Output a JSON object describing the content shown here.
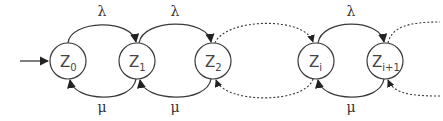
{
  "diagram": {
    "type": "state-transition",
    "states": [
      {
        "id": "Z0",
        "base": "Z",
        "sub": "0",
        "cx": 68,
        "cy": 61
      },
      {
        "id": "Z1",
        "base": "Z",
        "sub": "1",
        "cx": 137,
        "cy": 61
      },
      {
        "id": "Z2",
        "base": "Z",
        "sub": "2",
        "cx": 213,
        "cy": 61
      },
      {
        "id": "Zi",
        "base": "Z",
        "sub": "i",
        "cx": 316,
        "cy": 61
      },
      {
        "id": "Zi+1",
        "base": "Z",
        "sub": "i+1",
        "cx": 385,
        "cy": 61
      }
    ],
    "initial_arrow": {
      "to": "Z0"
    },
    "forward_rate": "λ",
    "backward_rate": "μ",
    "forward_edges": [
      {
        "from": "Z0",
        "to": "Z1",
        "label": "λ",
        "style": "solid"
      },
      {
        "from": "Z1",
        "to": "Z2",
        "label": "λ",
        "style": "solid"
      },
      {
        "from": "Z2",
        "to": "Zi",
        "label": "",
        "style": "dotted"
      },
      {
        "from": "Zi",
        "to": "Zi+1",
        "label": "λ",
        "style": "solid"
      },
      {
        "from": "Zi+1",
        "to": "…",
        "label": "",
        "style": "dotted"
      }
    ],
    "backward_edges": [
      {
        "from": "Z1",
        "to": "Z0",
        "label": "μ",
        "style": "solid"
      },
      {
        "from": "Z2",
        "to": "Z1",
        "label": "μ",
        "style": "solid"
      },
      {
        "from": "Zi",
        "to": "Z2",
        "label": "",
        "style": "dotted"
      },
      {
        "from": "Zi+1",
        "to": "Zi",
        "label": "μ",
        "style": "solid"
      },
      {
        "from": "…",
        "to": "Zi+1",
        "label": "",
        "style": "dotted"
      }
    ]
  },
  "labels": {
    "lambda_1": "λ",
    "lambda_2": "λ",
    "lambda_3": "λ",
    "mu_1": "μ",
    "mu_2": "μ",
    "mu_3": "μ",
    "z0": {
      "base": "Z",
      "sub": "0"
    },
    "z1": {
      "base": "Z",
      "sub": "1"
    },
    "z2": {
      "base": "Z",
      "sub": "2"
    },
    "zi": {
      "base": "Z",
      "sub": "i"
    },
    "zi1": {
      "base": "Z",
      "sub": "i+1"
    }
  }
}
